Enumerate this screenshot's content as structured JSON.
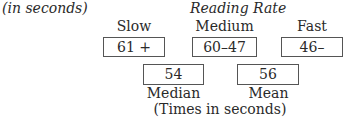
{
  "caption_top": "(in seconds)",
  "title": "Reading Rate",
  "categories": [
    {
      "label": "Slow",
      "range": "61 +"
    },
    {
      "label": "Medium",
      "range": "60–47"
    },
    {
      "label": "Fast",
      "range": "46–"
    }
  ],
  "stats": [
    {
      "label": "Median",
      "value": "54"
    },
    {
      "label": "Mean",
      "value": "56"
    }
  ],
  "caption_bottom": "(Times in seconds)"
}
